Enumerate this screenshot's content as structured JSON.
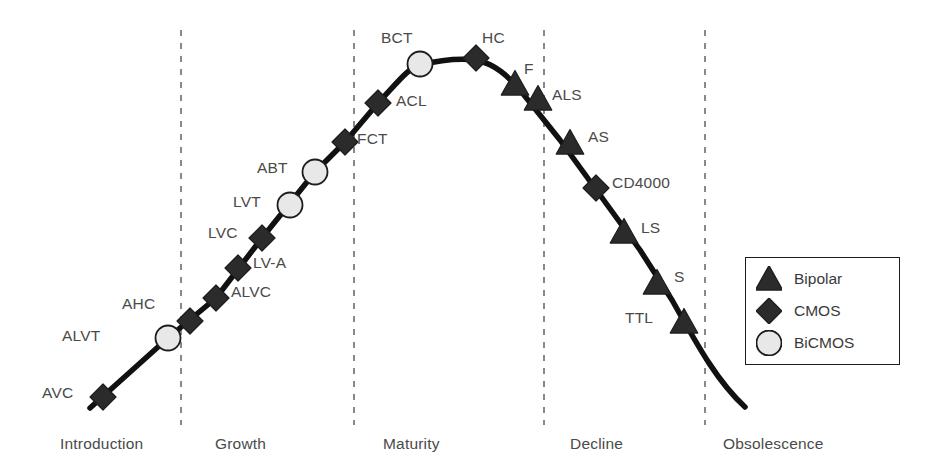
{
  "chart_data": {
    "type": "line",
    "title": "",
    "xlabel": "",
    "ylabel": "",
    "grid": false,
    "legend_position": "bottom-right",
    "phases": [
      {
        "name": "Introduction",
        "label_x": 60,
        "label_y": 435
      },
      {
        "name": "Growth",
        "label_x": 215,
        "label_y": 435
      },
      {
        "name": "Maturity",
        "label_x": 383,
        "label_y": 435
      },
      {
        "name": "Decline",
        "label_x": 570,
        "label_y": 435
      },
      {
        "name": "Obsolescence",
        "label_x": 723,
        "label_y": 435
      }
    ],
    "phase_dividers_x": [
      181,
      354,
      544,
      705
    ],
    "divider_y_range": [
      30,
      425
    ],
    "curve_path": "M 90 408 L 168 338 L 216 298 L 262 238 L 315 172 L 345 142 L 378 103 C 398 82 408 68 420 65 C 440 60 458 58 476 60 C 495 64 508 76 520 90 L 560 140 L 600 195 L 640 250 L 672 300 C 700 350 718 382 745 407",
    "series": [
      {
        "name": "Bipolar",
        "marker": "triangle",
        "fill": "#2b2b2b",
        "points": [
          {
            "label": "F",
            "x": 515,
            "y": 84,
            "lx": 524,
            "ly": 60,
            "anchor": "start"
          },
          {
            "label": "ALS",
            "x": 538,
            "y": 99,
            "lx": 552,
            "ly": 86,
            "anchor": "start"
          },
          {
            "label": "AS",
            "x": 570,
            "y": 143,
            "lx": 588,
            "ly": 128,
            "anchor": "start"
          },
          {
            "label": "LS",
            "x": 624,
            "y": 232,
            "lx": 641,
            "ly": 219,
            "anchor": "start"
          },
          {
            "label": "S",
            "x": 657,
            "y": 283,
            "lx": 674,
            "ly": 268,
            "anchor": "start"
          },
          {
            "label": "TTL",
            "x": 684,
            "y": 322,
            "lx": 625,
            "ly": 309,
            "anchor": "start"
          }
        ]
      },
      {
        "name": "CMOS",
        "marker": "diamond",
        "fill": "#2b2b2b",
        "points": [
          {
            "label": "AVC",
            "x": 103,
            "y": 397,
            "lx": 42,
            "ly": 384,
            "anchor": "start"
          },
          {
            "label": "AHC",
            "x": 190,
            "y": 321,
            "lx": 122,
            "ly": 295,
            "anchor": "start"
          },
          {
            "label": "ALVC",
            "x": 216,
            "y": 298,
            "lx": 231,
            "ly": 283,
            "anchor": "start"
          },
          {
            "label": "LV-A",
            "x": 238,
            "y": 268,
            "lx": 253,
            "ly": 254,
            "anchor": "start"
          },
          {
            "label": "LVC",
            "x": 262,
            "y": 238,
            "lx": 208,
            "ly": 224,
            "anchor": "start"
          },
          {
            "label": "FCT",
            "x": 345,
            "y": 142,
            "lx": 357,
            "ly": 130,
            "anchor": "start"
          },
          {
            "label": "ACL",
            "x": 378,
            "y": 103,
            "lx": 396,
            "ly": 92,
            "anchor": "start"
          },
          {
            "label": "HC",
            "x": 476,
            "y": 58,
            "lx": 482,
            "ly": 29,
            "anchor": "start"
          },
          {
            "label": "CD4000",
            "x": 596,
            "y": 188,
            "lx": 612,
            "ly": 174,
            "anchor": "start"
          }
        ]
      },
      {
        "name": "BiCMOS",
        "marker": "circle",
        "fill": "#e8e8e8",
        "points": [
          {
            "label": "ALVT",
            "x": 168,
            "y": 338,
            "lx": 62,
            "ly": 327,
            "anchor": "start"
          },
          {
            "label": "LVT",
            "x": 290,
            "y": 205,
            "lx": 233,
            "ly": 193,
            "anchor": "start"
          },
          {
            "label": "ABT",
            "x": 315,
            "y": 172,
            "lx": 257,
            "ly": 159,
            "anchor": "start"
          },
          {
            "label": "BCT",
            "x": 420,
            "y": 64,
            "lx": 381,
            "ly": 29,
            "anchor": "start"
          }
        ]
      }
    ]
  },
  "legend": {
    "items": [
      {
        "label": "Bipolar",
        "marker": "triangle",
        "fill": "#2b2b2b"
      },
      {
        "label": "CMOS",
        "marker": "diamond",
        "fill": "#2b2b2b"
      },
      {
        "label": "BiCMOS",
        "marker": "circle",
        "fill": "#e8e8e8"
      }
    ]
  },
  "colors": {
    "curve": "#111111",
    "marker_dark": "#2b2b2b",
    "marker_light": "#e8e8e8",
    "marker_stroke": "#1c1c1c",
    "divider": "#6b6b6b",
    "text": "#4a4a4a",
    "background": "#ffffff"
  }
}
